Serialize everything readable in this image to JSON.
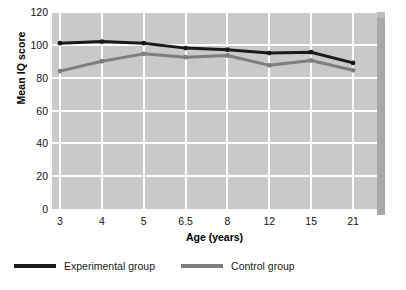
{
  "chart_data": {
    "type": "line",
    "title": "",
    "xlabel": "Age (years)",
    "ylabel": "Mean IQ score",
    "categories": [
      "3",
      "4",
      "5",
      "6.5",
      "8",
      "12",
      "15",
      "21"
    ],
    "yticks": [
      0,
      20,
      40,
      60,
      80,
      100,
      120
    ],
    "ylim": [
      0,
      120
    ],
    "grid": true,
    "legend_position": "bottom-left",
    "series": [
      {
        "name": "Experimental group",
        "color": "#1a1a1a",
        "values": [
          101,
          102,
          101,
          98,
          97,
          95,
          95.5,
          89
        ]
      },
      {
        "name": "Control group",
        "color": "#7d7d7d",
        "values": [
          84,
          90,
          94.5,
          92.5,
          93.5,
          87.5,
          90.5,
          84.5
        ]
      }
    ]
  },
  "legend": {
    "items": [
      {
        "label": "Experimental group",
        "color": "#1a1a1a"
      },
      {
        "label": "Control group",
        "color": "#7d7d7d"
      }
    ]
  },
  "colors": {
    "plot_background": "#c9c9c9",
    "gridline": "#ffffff",
    "page_background": "#ffffff",
    "shadow_right": "#a8a8a8",
    "shadow_top": "#b5b5b5",
    "experimental": "#1a1a1a",
    "control": "#7d7d7d"
  }
}
